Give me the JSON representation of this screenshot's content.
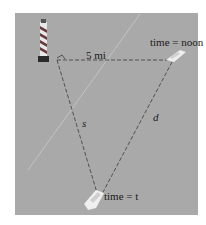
{
  "diagram": {
    "labels": {
      "distance_top": "5 mi",
      "time_top": "time = noon",
      "segment_left": "s",
      "segment_right": "d",
      "time_bottom": "time = t"
    },
    "objects": {
      "lighthouse": "lighthouse-icon",
      "boat_start": "boat-icon",
      "boat_end": "boat-icon"
    },
    "colors": {
      "background": "#a9a9a9",
      "dash_line": "#3a3a3a",
      "text": "#1a1a1a"
    }
  }
}
